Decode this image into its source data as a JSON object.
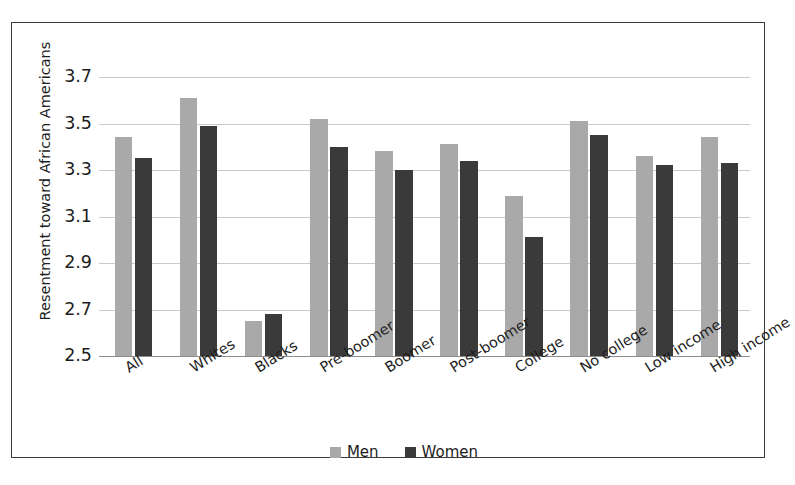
{
  "chart_data": {
    "type": "bar",
    "title": "",
    "subtitle": "",
    "xlabel": "",
    "ylabel": "Resentment toward African Americans",
    "ylim": [
      2.5,
      3.7
    ],
    "ytick_labels": [
      "3.7",
      "3.5",
      "3.3",
      "3.1",
      "2.9",
      "2.7",
      "2.5"
    ],
    "ytick_values": [
      3.7,
      3.5,
      3.3,
      3.1,
      2.9,
      2.7,
      2.5
    ],
    "grid": true,
    "legend_position": "bottom-center",
    "categories": [
      "All",
      "Whites",
      "Blacks",
      "Pre-boomer",
      "Boomer",
      "Post-boomer",
      "College",
      "No college",
      "Low income",
      "High income"
    ],
    "series": [
      {
        "name": "Men",
        "color": "#a9a9a9",
        "values": [
          3.44,
          3.61,
          2.65,
          3.52,
          3.38,
          3.41,
          3.19,
          3.51,
          3.36,
          3.44
        ]
      },
      {
        "name": "Women",
        "color": "#3a3a3a",
        "values": [
          3.35,
          3.49,
          2.68,
          3.4,
          3.3,
          3.34,
          3.01,
          3.45,
          3.32,
          3.33
        ]
      }
    ]
  },
  "legend": {
    "entries": [
      {
        "label": "Men"
      },
      {
        "label": "Women"
      }
    ]
  },
  "colors": {
    "men": "#a9a9a9",
    "women": "#3a3a3a",
    "grid": "#c9c9c9",
    "axis": "#8d8d8d",
    "frame": "#3c3c3c",
    "text": "#1d1d1d",
    "background": "#ffffff"
  }
}
